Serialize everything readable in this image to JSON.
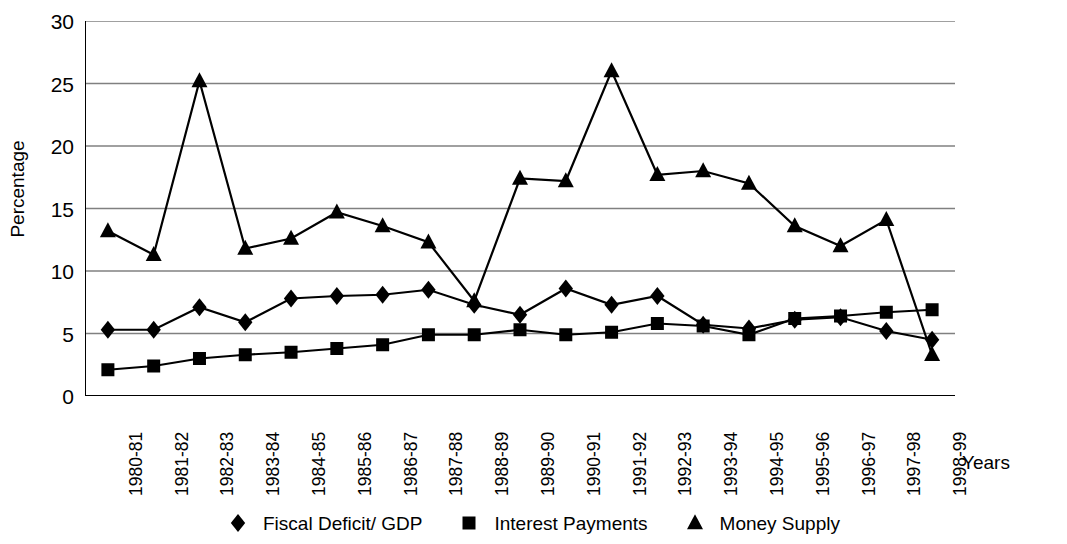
{
  "chart_data": {
    "type": "line",
    "title": "",
    "xlabel": "Years",
    "ylabel": "Percentage",
    "ylim": [
      0,
      30
    ],
    "yticks": [
      0,
      5,
      10,
      15,
      20,
      25,
      30
    ],
    "grid": true,
    "legend_position": "bottom",
    "categories": [
      "1980-81",
      "1981-82",
      "1982-83",
      "1983-84",
      "1984-85",
      "1985-86",
      "1986-87",
      "1987-88",
      "1988-89",
      "1989-90",
      "1990-91",
      "1991-92",
      "1992-93",
      "1993-94",
      "1994-95",
      "1995-96",
      "1996-97",
      "1997-98",
      "1998-99"
    ],
    "series": [
      {
        "name": "Fiscal Deficit/ GDP",
        "marker": "diamond",
        "values": [
          5.3,
          5.3,
          7.1,
          5.9,
          7.8,
          8.0,
          8.1,
          8.5,
          7.3,
          6.5,
          8.6,
          7.3,
          8.0,
          5.7,
          5.4,
          6.1,
          6.3,
          5.2,
          4.5
        ]
      },
      {
        "name": "Interest Payments",
        "marker": "square",
        "values": [
          2.1,
          2.4,
          3.0,
          3.3,
          3.5,
          3.8,
          4.1,
          4.9,
          4.9,
          5.3,
          4.9,
          5.1,
          5.8,
          5.6,
          4.9,
          6.2,
          6.4,
          6.7,
          6.9
        ]
      },
      {
        "name": "Money Supply",
        "marker": "triangle",
        "values": [
          13.2,
          11.3,
          25.2,
          11.8,
          12.6,
          14.7,
          13.6,
          12.3,
          7.6,
          17.4,
          17.2,
          26.0,
          17.7,
          18.0,
          17.0,
          13.6,
          12.0,
          14.1,
          3.3
        ]
      }
    ],
    "colors": {
      "series_line": "#000000",
      "axis": "#000000",
      "grid": "#808080",
      "background": "#ffffff"
    }
  },
  "legend": {
    "items": [
      {
        "label": "Fiscal Deficit/ GDP",
        "marker": "diamond-marker-icon"
      },
      {
        "label": "Interest Payments",
        "marker": "square-marker-icon"
      },
      {
        "label": "Money Supply",
        "marker": "triangle-marker-icon"
      }
    ]
  }
}
